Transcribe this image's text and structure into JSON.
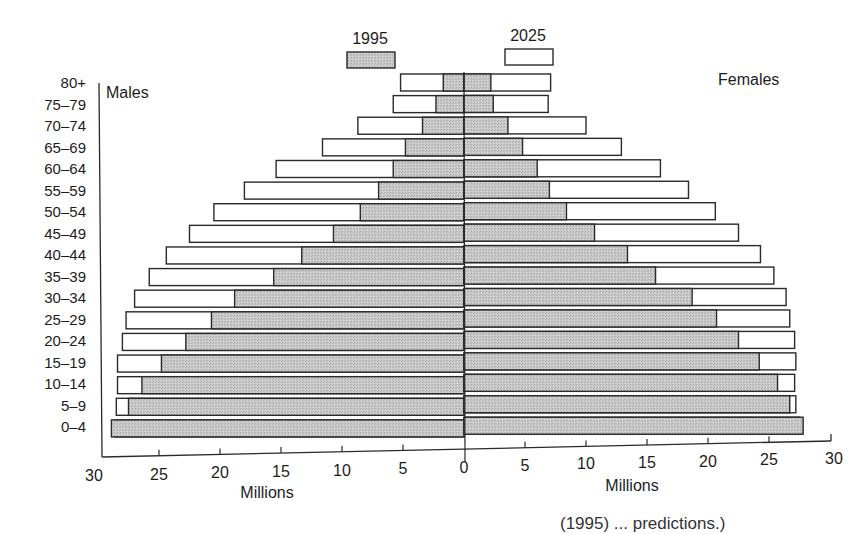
{
  "chart_data": {
    "type": "bar",
    "subtype": "population-pyramid",
    "title": "",
    "xlabel": "Millions",
    "ylabel": "",
    "xlim": [
      30,
      30
    ],
    "x_ticks_left": [
      "30",
      "25",
      "20",
      "15",
      "10",
      "5",
      "0"
    ],
    "x_ticks_right": [
      "5",
      "10",
      "15",
      "20",
      "25",
      "30"
    ],
    "x_axis_label_left": "Millions",
    "x_axis_label_right": "Millions",
    "side_labels": {
      "left": "Males",
      "right": "Females"
    },
    "legend": [
      {
        "name": "1995",
        "style": "shaded-gray",
        "color": "#c4c4c4"
      },
      {
        "name": "2025",
        "style": "white-outline",
        "color": "#ffffff"
      }
    ],
    "legend_position": "top-center",
    "grid": false,
    "categories": [
      "80+",
      "75–79",
      "70–74",
      "65–69",
      "60–64",
      "55–59",
      "50–54",
      "45–49",
      "40–44",
      "35–39",
      "30–34",
      "25–29",
      "20–24",
      "15–19",
      "10–14",
      "5–9",
      "0–4"
    ],
    "series": [
      {
        "name": "Males 1995",
        "side": "left",
        "values": [
          1.7,
          2.3,
          3.4,
          4.8,
          5.8,
          7.0,
          8.5,
          10.7,
          13.3,
          15.6,
          18.8,
          20.7,
          22.8,
          24.8,
          26.4,
          27.5,
          28.9
        ]
      },
      {
        "name": "Males 2025",
        "side": "left",
        "values": [
          5.2,
          5.8,
          8.7,
          11.6,
          15.4,
          18.0,
          20.5,
          22.5,
          24.4,
          25.8,
          27.0,
          27.7,
          28.0,
          28.4,
          28.4,
          28.5,
          28.6
        ]
      },
      {
        "name": "Females 1995",
        "side": "right",
        "values": [
          2.2,
          2.4,
          3.6,
          4.8,
          6.0,
          7.0,
          8.4,
          10.7,
          13.4,
          15.7,
          18.7,
          20.7,
          22.5,
          24.2,
          25.7,
          26.7,
          27.8
        ]
      },
      {
        "name": "Females 2025",
        "side": "right",
        "values": [
          7.1,
          6.9,
          10.0,
          12.9,
          16.1,
          18.4,
          20.6,
          22.5,
          24.3,
          25.4,
          26.4,
          26.7,
          27.1,
          27.2,
          27.1,
          27.2,
          27.5
        ]
      }
    ]
  },
  "caption_fragment": "(1995) ... predictions.)"
}
